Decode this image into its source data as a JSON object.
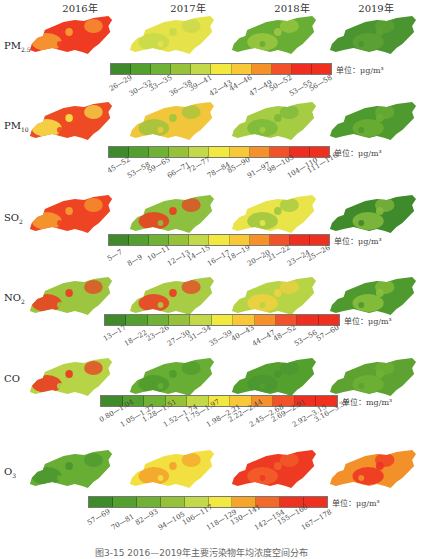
{
  "years": [
    "2016年",
    "2017年",
    "2018年",
    "2019年"
  ],
  "colors": {
    "pm_scale": [
      "#3f8a2a",
      "#54a02e",
      "#6fb236",
      "#96c23a",
      "#c3d94a",
      "#f2e840",
      "#f8c838",
      "#f5902a",
      "#f2522a",
      "#ee2e20",
      "#f0301e"
    ],
    "o3_scale": [
      "#3f8a2a",
      "#54a02e",
      "#6fb236",
      "#96c23a",
      "#c3d94a",
      "#f2e840",
      "#f5a62a",
      "#f26a2a",
      "#ee3222",
      "#f0301e"
    ]
  },
  "rows": [
    {
      "pollutant": "PM",
      "subscript": "2.5",
      "unit": "单位：μg/m³",
      "bins": [
        "26—29",
        "30—32",
        "33—35",
        "36—38",
        "39—41",
        "42—43",
        "44—46",
        "47—49",
        "50—52",
        "53—55",
        "56—58"
      ],
      "map_dominant_colors": [
        "#ef3b22",
        "#e6e24a",
        "#68ad34",
        "#4a9530"
      ],
      "map_accent_colors": [
        "#f7a133",
        "#c5d94a",
        "#9cc840",
        "#5ea232"
      ]
    },
    {
      "pollutant": "PM",
      "subscript": "10",
      "unit": "单位：μg/m³",
      "bins": [
        "45—52",
        "53—58",
        "59—65",
        "66—71",
        "72—77",
        "78—84",
        "85—90",
        "91—97",
        "98—103",
        "104—110",
        "111—116"
      ],
      "map_dominant_colors": [
        "#ee4a24",
        "#f2c63a",
        "#a6cc44",
        "#4e9a2e"
      ],
      "map_accent_colors": [
        "#f4e64a",
        "#9ec43e",
        "#7bb83a",
        "#6cae34"
      ]
    },
    {
      "pollutant": "SO",
      "subscript": "2",
      "unit": "单位：μg/m³",
      "bins": [
        "5—7",
        "8—9",
        "10—11",
        "12—13",
        "14—15",
        "16—17",
        "18—19",
        "20—20",
        "21—22",
        "23—24",
        "25—26"
      ],
      "map_dominant_colors": [
        "#ee4424",
        "#8cc03e",
        "#e8e44a",
        "#3f8a2a"
      ],
      "map_accent_colors": [
        "#f5a030",
        "#ee3a22",
        "#9cc640",
        "#86bb3e"
      ]
    },
    {
      "pollutant": "NO",
      "subscript": "2",
      "unit": "单位：μg/m³",
      "bins": [
        "13—17",
        "18—22",
        "23—26",
        "27—30",
        "31—34",
        "35—39",
        "40—43",
        "44—47",
        "48—52",
        "53—56",
        "57—60"
      ],
      "map_dominant_colors": [
        "#9cc640",
        "#a8cc44",
        "#b6d446",
        "#4e9a2e"
      ],
      "map_accent_colors": [
        "#ee3a22",
        "#ee3a22",
        "#f2d040",
        "#8cbf3c"
      ]
    },
    {
      "pollutant": "CO",
      "subscript": "",
      "unit": "单位：mg/m³",
      "bins": [
        "0.80—1.04",
        "1.05—1.27",
        "1.28—1.51",
        "1.52—1.74",
        "1.75—1.97",
        "1.98—2.21",
        "2.22—2.44",
        "2.45—2.68",
        "2.69—2.91",
        "2.92—3.15",
        "3.16—3.38"
      ],
      "map_dominant_colors": [
        "#b6d446",
        "#68ad34",
        "#54a02e",
        "#5ea232"
      ],
      "map_accent_colors": [
        "#ee3222",
        "#4e9a2e",
        "#4a9530",
        "#6fb236"
      ]
    },
    {
      "pollutant": "O",
      "subscript": "3",
      "unit": "单位：μg/m³",
      "bins": [
        "57—69",
        "70—81",
        "82—93",
        "94—105",
        "106—117",
        "118—129",
        "130—141",
        "142—154",
        "155—166",
        "167—178"
      ],
      "map_dominant_colors": [
        "#68ad34",
        "#f2e040",
        "#ee3a22",
        "#f2902a"
      ],
      "map_accent_colors": [
        "#4a9530",
        "#f5a02a",
        "#f2602a",
        "#ee3222"
      ]
    }
  ],
  "caption": "图3-15 2016—2019年主要污染物年均浓度空间分布"
}
